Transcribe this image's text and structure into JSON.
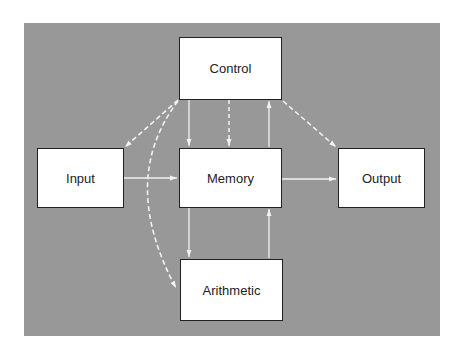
{
  "diagram": {
    "background_color": "#989898",
    "box_color": "#ffffff",
    "arrow_color": "#f2f2f2",
    "nodes": {
      "control": {
        "label": "Control"
      },
      "input": {
        "label": "Input"
      },
      "memory": {
        "label": "Memory"
      },
      "output": {
        "label": "Output"
      },
      "arithmetic": {
        "label": "Arithmetic"
      }
    },
    "edges": [
      {
        "from": "Input",
        "to": "Memory",
        "style": "solid"
      },
      {
        "from": "Memory",
        "to": "Output",
        "style": "solid"
      },
      {
        "from": "Control",
        "to": "Memory",
        "style": "solid"
      },
      {
        "from": "Memory",
        "to": "Control",
        "style": "solid"
      },
      {
        "from": "Control",
        "to": "Memory",
        "style": "dashed"
      },
      {
        "from": "Memory",
        "to": "Arithmetic",
        "style": "solid"
      },
      {
        "from": "Arithmetic",
        "to": "Memory",
        "style": "solid"
      },
      {
        "from": "Control",
        "to": "Input",
        "style": "dashed"
      },
      {
        "from": "Control",
        "to": "Output",
        "style": "dashed"
      },
      {
        "from": "Control",
        "to": "Arithmetic",
        "style": "dashed-curve"
      }
    ]
  }
}
